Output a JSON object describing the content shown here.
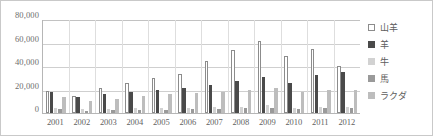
{
  "chart_data": {
    "type": "bar",
    "title": "",
    "xlabel": "",
    "ylabel": "",
    "ylim": [
      0,
      80000
    ],
    "yticks": [
      "80,000",
      "60,000",
      "40,000",
      "20,000",
      "0"
    ],
    "ytick_values": [
      80000,
      60000,
      40000,
      20000,
      0
    ],
    "grid": true,
    "legend_position": "right",
    "categories": [
      "2001",
      "2002",
      "2003",
      "2004",
      "2005",
      "2006",
      "2007",
      "2008",
      "2009",
      "2010",
      "2011",
      "2012"
    ],
    "series": [
      {
        "name": "山羊",
        "color": "#ffffff",
        "values": [
          18500,
          14500,
          21000,
          25500,
          29500,
          33500,
          44500,
          54000,
          61500,
          48500,
          54500,
          40000
        ]
      },
      {
        "name": "羊",
        "color": "#4a4a4a",
        "values": [
          17500,
          14000,
          16000,
          18000,
          19500,
          21000,
          24000,
          27500,
          30500,
          25500,
          32500,
          35000
        ]
      },
      {
        "name": "牛",
        "color": "#d2d2d2",
        "values": [
          4500,
          3000,
          3500,
          4000,
          4000,
          4500,
          5000,
          5500,
          6500,
          4500,
          5000,
          5000
        ]
      },
      {
        "name": "馬",
        "color": "#9a9a9a",
        "values": [
          3000,
          2000,
          2500,
          2500,
          2500,
          3000,
          3500,
          4000,
          4500,
          3500,
          4000,
          4000
        ]
      },
      {
        "name": "ラクダ",
        "color": "#bdbdbd",
        "values": [
          13500,
          10500,
          12000,
          14500,
          16000,
          17000,
          18000,
          19500,
          21000,
          17500,
          19500,
          19500
        ]
      }
    ]
  }
}
